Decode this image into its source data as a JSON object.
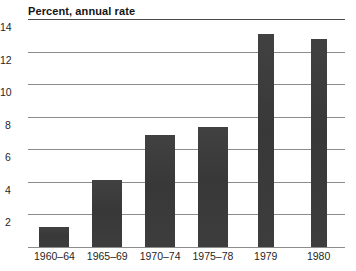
{
  "chart_data": {
    "type": "bar",
    "title": "Percent, annual rate",
    "xlabel": "",
    "ylabel": "",
    "categories": [
      "1960–64",
      "1965–69",
      "1970–74",
      "1975–78",
      "1979",
      "1980"
    ],
    "values": [
      1.2,
      4.1,
      6.9,
      7.4,
      13.1,
      12.8
    ],
    "ylim": [
      0,
      14
    ],
    "yticks": [
      2,
      4,
      6,
      8,
      10,
      12,
      14
    ],
    "ytick_labels": [
      "2",
      "4",
      "6",
      "8",
      "10",
      "12",
      "14"
    ],
    "grid": true,
    "legend": false,
    "legend_position": "none",
    "bar_color": "#3b3b3b",
    "gridline_color": "#8c8c8c",
    "background_color": "#ffffff",
    "bar_widths_px": [
      30,
      30,
      30,
      30,
      16,
      16
    ]
  }
}
